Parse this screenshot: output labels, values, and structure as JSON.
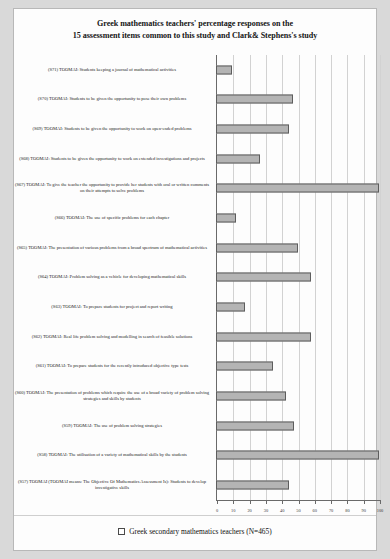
{
  "title": {
    "line1": "Greek mathematics teachers' percentage responses on the",
    "line2": "15 assessment items common to this study and Clark& Stephens's study"
  },
  "legend": {
    "label": "Greek secondary mathematics teachers (N=465)"
  },
  "chart_data": {
    "type": "bar",
    "orientation": "horizontal",
    "title": "Greek mathematics teachers' percentage responses on the 15 assessment items common to this study and Clark& Stephens's study",
    "xlabel": "",
    "ylabel": "",
    "xlim": [
      0,
      100
    ],
    "xticks": [
      0,
      10,
      20,
      30,
      40,
      50,
      60,
      70,
      80,
      90,
      100
    ],
    "grid": true,
    "legend_position": "bottom",
    "series": [
      {
        "name": "Greek secondary mathematics teachers (N=465)",
        "color": "#b4b4b4",
        "values": [
          10,
          47,
          45,
          27,
          100,
          12,
          50,
          58,
          18,
          58,
          35,
          43,
          48,
          100,
          45
        ]
      }
    ],
    "categories": [
      "(S71) TOOMAI: Students keeping a journal of mathematical activities",
      "(S70) TOOMAI: Students to be given the opportunity to pose their own problems",
      "(S69) TOOMAI: Students to be given the opportunity to work on open-ended problems",
      "(S68) TOOMAI: Students to be given the opportunity to work on extended investigations and projects",
      "(S67) TOOMAI: To give the teacher the opportunity to provide her students with oral or written comments on their attempts to solve problems",
      "(S66) TOOMAI: The use of specific problems for each chapter",
      "(S65) TOOMAI: The presentation of various problems from a broad spectrum of mathematical activities",
      "(S64) TOOMAI: Problem solving as a vehicle for developing mathematical skills",
      "(S63) TOOMAI: To prepare students for project and report writing",
      "(S62) TOOMAI: Real life problem solving and modelling in search of feasible solutions",
      "(S61) TOOMAI: To prepare students for the recently introduced objective type tests",
      "(S60) TOOMAI: The presentation of problems which require the use of a broad variety of problem solving strategies and skills by students",
      "(S59) TOOMAI: The use of problem solving strategies",
      "(S58) TOOMAI: The utilisation of a variety of mathematical skills by the students",
      "(S57) TOOMAI (TOOMAI means: The Objective Of Mathematics Assessment Is): Students to develop investigative skills"
    ]
  }
}
